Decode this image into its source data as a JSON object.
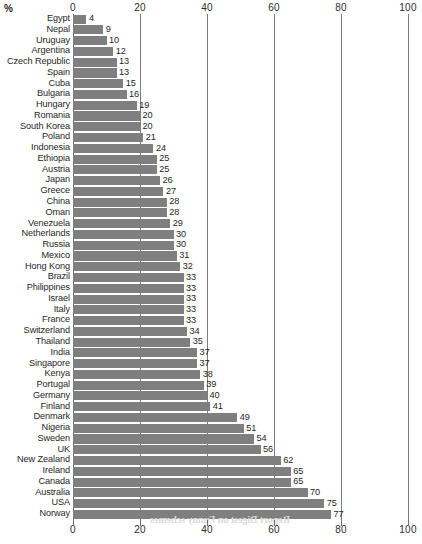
{
  "chart_data": {
    "type": "bar",
    "orientation": "horizontal",
    "title": "",
    "subtitle": "",
    "xlabel": "%",
    "ylabel": "",
    "xlim": [
      0,
      100
    ],
    "xticks": [
      0,
      20,
      40,
      60,
      80,
      100
    ],
    "grid": true,
    "grid_axis": "x",
    "legend": null,
    "bar_color": "#7f7f7f",
    "axis_color": "#6b6b6b",
    "value_labels": true,
    "categories": [
      "Egypt",
      "Nepal",
      "Uruguay",
      "Argentina",
      "Czech Republic",
      "Spain",
      "Cuba",
      "Bulgaria",
      "Hungary",
      "Romania",
      "South Korea",
      "Poland",
      "Indonesia",
      "Ethiopia",
      "Austria",
      "Japan",
      "Greece",
      "China",
      "Oman",
      "Venezuela",
      "Netherlands",
      "Russia",
      "Mexico",
      "Hong Kong",
      "Brazil",
      "Philippines",
      "Israel",
      "Italy",
      "France",
      "Switzerland",
      "Thailand",
      "India",
      "Singapore",
      "Kenya",
      "Portugal",
      "Germany",
      "Finland",
      "Denmark",
      "Nigeria",
      "Sweden",
      "UK",
      "New Zealand",
      "Ireland",
      "Canada",
      "Australia",
      "USA",
      "Norway"
    ],
    "values": [
      4,
      9,
      10,
      12,
      13,
      13,
      15,
      16,
      19,
      20,
      20,
      21,
      24,
      25,
      25,
      26,
      27,
      28,
      28,
      29,
      30,
      30,
      31,
      32,
      33,
      33,
      33,
      33,
      33,
      34,
      35,
      37,
      37,
      38,
      39,
      40,
      41,
      49,
      51,
      54,
      56,
      62,
      65,
      65,
      70,
      75,
      77
    ]
  },
  "axis": {
    "unit_label": "%",
    "ticks": [
      "0",
      "20",
      "40",
      "60",
      "80",
      "100"
    ]
  },
  "bleed_through": "Report Digest on Funny schemes"
}
